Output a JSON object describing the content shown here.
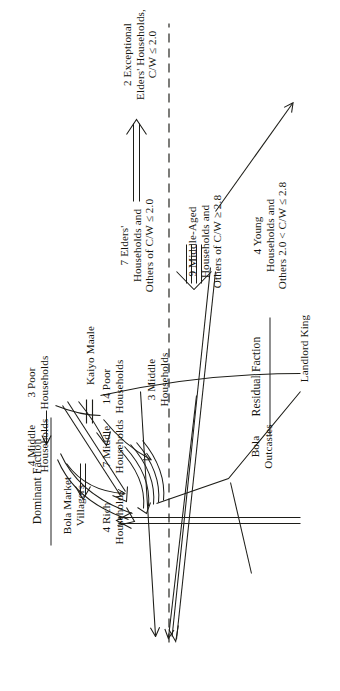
{
  "figure": {
    "orientation": "rotated-90",
    "groups": {
      "dominant_faction": "Dominant Faction",
      "residual_faction": "Residual Faction"
    },
    "categories": {
      "bola_outcastes": "Bola\nOutcastes",
      "bola_market_villagers": "Bola Market\nVillagers",
      "kaiyo_maale": "Kaiyo Maale",
      "landlord_king": "Landlord King"
    },
    "nodes": {
      "rich4": "4 Rich\nHouseholds",
      "middle7": "7 Middle\nHouseholds",
      "poor14": "14 Poor\nHouseholds",
      "middle4": "4 Middle\nHouseholds",
      "poor3": "3 Poor\nHouseholds",
      "middle3": "3 Middle\nHouseholds",
      "elders7": "7 Elders'\nHouseholds and\nOthers of C/W ≤ 2.0",
      "middleaged9": "9 Middle-Aged\nHouseholds and\nOthers of C/W ≥ 2.8",
      "young4": "4 Young\nHouseholds and\nOthers 2.0 < C/W ≤ 2.8",
      "exceptional2": "2 Exceptional\nElders' Households,\nC/W ≤ 2.0"
    },
    "colors": {
      "ink": "#15150f",
      "line": "#1d1d18",
      "paper": "#ffffff"
    }
  }
}
